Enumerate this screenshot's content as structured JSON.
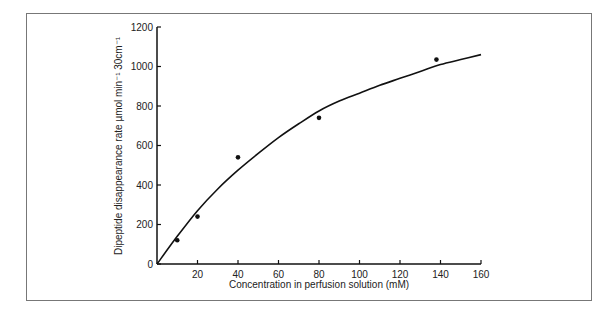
{
  "chart_data": {
    "type": "scatter",
    "title": "",
    "xlabel": "Concentration in perfusion solution (mM)",
    "ylabel": "Dipeptide disappearance rate µmol min⁻¹ 30cm⁻¹",
    "xlim": [
      0,
      160
    ],
    "ylim": [
      0,
      1200
    ],
    "xticks": [
      20,
      40,
      60,
      80,
      100,
      120,
      140,
      160
    ],
    "yticks": [
      0,
      200,
      400,
      600,
      800,
      1000,
      1200
    ],
    "grid": false,
    "series": [
      {
        "name": "observed",
        "kind": "points",
        "x": [
          10,
          20,
          40,
          80,
          138
        ],
        "y": [
          120,
          240,
          540,
          740,
          1035
        ]
      },
      {
        "name": "fitted curve",
        "kind": "line",
        "x": [
          0,
          10,
          20,
          30,
          40,
          50,
          60,
          70,
          80,
          90,
          100,
          110,
          120,
          130,
          140,
          150,
          160
        ],
        "y": [
          0,
          140,
          270,
          380,
          475,
          560,
          640,
          710,
          775,
          825,
          865,
          905,
          940,
          975,
          1010,
          1035,
          1060
        ]
      }
    ]
  }
}
